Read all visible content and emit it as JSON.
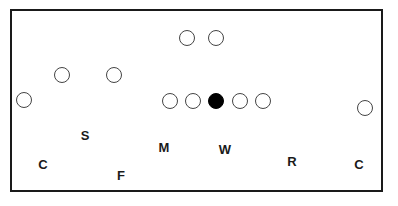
{
  "diagram": {
    "type": "football-defensive-formation",
    "offense": [
      {
        "id": "o1",
        "x": 187,
        "y": 38,
        "filled": false
      },
      {
        "id": "o2",
        "x": 216,
        "y": 38,
        "filled": false
      },
      {
        "id": "o3",
        "x": 62,
        "y": 75,
        "filled": false
      },
      {
        "id": "o4",
        "x": 114,
        "y": 75,
        "filled": false
      },
      {
        "id": "o5",
        "x": 24,
        "y": 100,
        "filled": false
      },
      {
        "id": "o6",
        "x": 170,
        "y": 101,
        "filled": false
      },
      {
        "id": "o7",
        "x": 193,
        "y": 101,
        "filled": false
      },
      {
        "id": "center",
        "x": 216,
        "y": 101,
        "filled": true
      },
      {
        "id": "o9",
        "x": 240,
        "y": 101,
        "filled": false
      },
      {
        "id": "o10",
        "x": 263,
        "y": 101,
        "filled": false
      },
      {
        "id": "o11",
        "x": 365,
        "y": 108,
        "filled": false
      }
    ],
    "defense": [
      {
        "label": "S",
        "x": 85,
        "y": 135
      },
      {
        "label": "M",
        "x": 164,
        "y": 147
      },
      {
        "label": "W",
        "x": 225,
        "y": 149
      },
      {
        "label": "R",
        "x": 292,
        "y": 161
      },
      {
        "label": "C",
        "x": 43,
        "y": 164
      },
      {
        "label": "C",
        "x": 359,
        "y": 164
      },
      {
        "label": "F",
        "x": 121,
        "y": 175
      }
    ]
  }
}
